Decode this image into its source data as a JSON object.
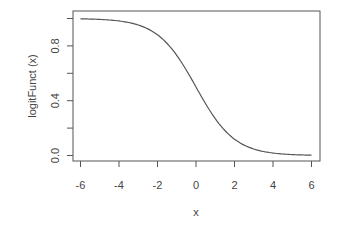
{
  "chart_data": {
    "type": "line",
    "title": "",
    "xlabel": "x",
    "ylabel": "logitFunct (x)",
    "xlim": [
      -6,
      6
    ],
    "ylim": [
      0,
      1
    ],
    "x_ticks": [
      -6,
      -4,
      -2,
      0,
      2,
      4,
      6
    ],
    "x_tick_labels": [
      "-6",
      "-4",
      "-2",
      "0",
      "2",
      "4",
      "6"
    ],
    "y_ticks": [
      0.0,
      0.2,
      0.4,
      0.6,
      0.8,
      1.0
    ],
    "y_tick_labels": [
      "0.0",
      "",
      "0.4",
      "",
      "0.8",
      ""
    ],
    "grid": false,
    "legend": null,
    "series": [
      {
        "name": "logitFunct(x)",
        "color": "#555555",
        "x": [
          -6,
          -5,
          -4,
          -3,
          -2,
          -1,
          0,
          1,
          2,
          3,
          4,
          5,
          6
        ],
        "y": [
          0.9975,
          0.9933,
          0.982,
          0.9526,
          0.8808,
          0.7311,
          0.5,
          0.2689,
          0.1192,
          0.0474,
          0.018,
          0.0067,
          0.0025
        ]
      }
    ]
  },
  "colors": {
    "axis": "#555555",
    "line": "#555555",
    "text": "#444444",
    "background": "#ffffff"
  }
}
